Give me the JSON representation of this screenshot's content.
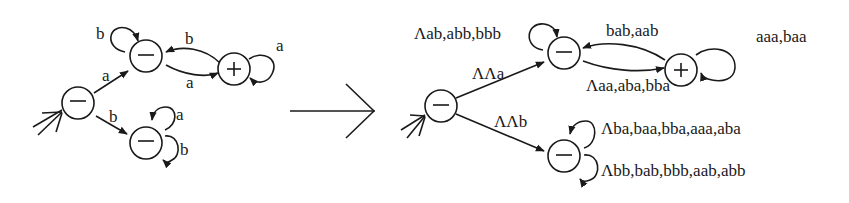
{
  "figure": {
    "transform_arrow": "→",
    "left_automaton": {
      "states": [
        {
          "id": "q0",
          "mark": "−",
          "start": true
        },
        {
          "id": "q1",
          "mark": "−"
        },
        {
          "id": "q2",
          "mark": "+"
        },
        {
          "id": "q3",
          "mark": "−"
        }
      ],
      "edges": [
        {
          "from": "q0",
          "to": "q1",
          "label": "a"
        },
        {
          "from": "q0",
          "to": "q3",
          "label": "b"
        },
        {
          "from": "q1",
          "to": "q1",
          "label": "b"
        },
        {
          "from": "q1",
          "to": "q2",
          "label": "a"
        },
        {
          "from": "q2",
          "to": "q1",
          "label": "b"
        },
        {
          "from": "q2",
          "to": "q2",
          "label": "a"
        },
        {
          "from": "q3",
          "to": "q3",
          "label": "a"
        },
        {
          "from": "q3",
          "to": "q3",
          "label": "b"
        }
      ]
    },
    "right_automaton": {
      "states": [
        {
          "id": "p0",
          "mark": "−",
          "start": true
        },
        {
          "id": "p1",
          "mark": "−"
        },
        {
          "id": "p2",
          "mark": "+"
        },
        {
          "id": "p3",
          "mark": "−"
        }
      ],
      "edges": [
        {
          "from": "p0",
          "to": "p1",
          "label": "ΛΛa"
        },
        {
          "from": "p0",
          "to": "p3",
          "label": "ΛΛb"
        },
        {
          "from": "p1",
          "to": "p1",
          "label": "Λab,abb,bbb"
        },
        {
          "from": "p1",
          "to": "p2",
          "label": "Λaa,aba,bba"
        },
        {
          "from": "p2",
          "to": "p1",
          "label": "bab,aab"
        },
        {
          "from": "p2",
          "to": "p2",
          "label": "aaa,baa"
        },
        {
          "from": "p3",
          "to": "p3",
          "label": "Λba,baa,bba,aaa,aba"
        },
        {
          "from": "p3",
          "to": "p3",
          "label": "Λbb,bab,bbb,aab,abb"
        }
      ]
    }
  }
}
